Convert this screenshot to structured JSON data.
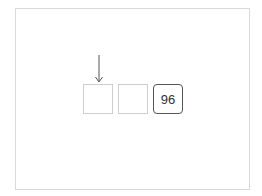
{
  "diagram": {
    "cells": [
      {
        "value": "",
        "filled": false
      },
      {
        "value": "",
        "filled": false
      },
      {
        "value": "96",
        "filled": true
      }
    ],
    "pointer": {
      "icon": "down-arrow-icon",
      "target_index": 0
    },
    "colors": {
      "frame": "#d9d9d9",
      "empty_border": "#cfcfcf",
      "filled_border": "#555555",
      "arrow": "#555555"
    }
  }
}
